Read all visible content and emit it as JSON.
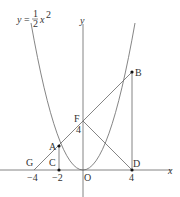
{
  "equation": {
    "y": "y",
    "eq": "=",
    "num": "1",
    "den": "2",
    "x": "x",
    "exp": "2"
  },
  "axes": {
    "x_label": "x",
    "y_label": "y"
  },
  "points": {
    "A": "A",
    "B": "B",
    "C": "C",
    "D": "D",
    "F": "F",
    "G": "G",
    "O": "O"
  },
  "ticks": {
    "neg4": "−4",
    "neg2": "−2",
    "pos4": "4",
    "f4": "4"
  },
  "colors": {
    "line": "#555555",
    "point": "#111111"
  }
}
